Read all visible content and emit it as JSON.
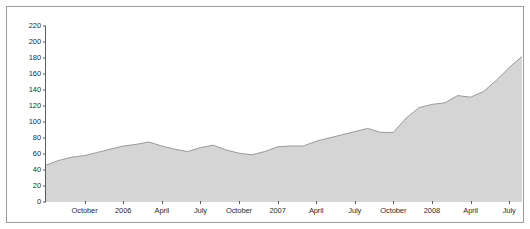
{
  "chart_data": {
    "type": "area",
    "title": "",
    "subtitle": "",
    "xlabel": "",
    "ylabel": "",
    "grid": false,
    "legend": null,
    "legend_position": "none",
    "ylim": [
      0,
      220
    ],
    "ytick_values": [
      0,
      20,
      40,
      60,
      80,
      100,
      120,
      140,
      160,
      180,
      200,
      220
    ],
    "ytick_labels": [
      "0",
      "20",
      "40",
      "60",
      "80",
      "100",
      "120",
      "140",
      "160",
      "180",
      "200",
      "220"
    ],
    "xtick_labels": [
      "October",
      "2006",
      "April",
      "July",
      "October",
      "2007",
      "April",
      "July",
      "October",
      "2008",
      "April",
      "July"
    ],
    "xtick_index": [
      3,
      6,
      9,
      12,
      15,
      18,
      21,
      24,
      27,
      30,
      33,
      36
    ],
    "x": [
      0,
      1,
      2,
      3,
      4,
      5,
      6,
      7,
      8,
      9,
      10,
      11,
      12,
      13,
      14,
      15,
      16,
      17,
      18,
      19,
      20,
      21,
      22,
      23,
      24,
      25,
      26,
      27,
      28,
      29,
      30,
      31,
      32,
      33,
      34,
      35,
      36,
      37
    ],
    "series": [
      {
        "name": "value",
        "fill_color": "#d5d5d5",
        "line_color": "#9a9a9a",
        "values": [
          46,
          52,
          56,
          58,
          62,
          66,
          70,
          72,
          75,
          70,
          66,
          63,
          68,
          71,
          65,
          61,
          59,
          63,
          69,
          70,
          70,
          76,
          80,
          84,
          88,
          92,
          87,
          87,
          105,
          118,
          122,
          124,
          133,
          131,
          138,
          152,
          168,
          182
        ]
      }
    ],
    "values_continued_note": ""
  },
  "axis": {
    "y_tick_color": "#5a5a5a",
    "x_tick_color": "#5a5a5a",
    "label_color": "#2b2b2b"
  },
  "frame": {
    "border_color": "#9b9b9b",
    "background": "#ffffff"
  }
}
